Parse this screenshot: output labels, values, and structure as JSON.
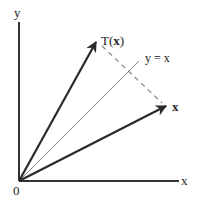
{
  "diagram": {
    "title": "",
    "labels": {
      "y_axis": "y",
      "x_axis": "x",
      "origin": "0",
      "vector_x": "x",
      "transform_prefix": "T(",
      "transform_arg": "x",
      "transform_suffix": ")",
      "line_label": "y = x"
    },
    "colors": {
      "axis": "#333333",
      "vector": "#2a2a2a",
      "line": "#888888",
      "dashed": "#888888"
    },
    "elements": [
      {
        "type": "axis",
        "name": "x-axis"
      },
      {
        "type": "axis",
        "name": "y-axis"
      },
      {
        "type": "vector",
        "name": "x",
        "from": [
          0,
          0
        ],
        "to": "x"
      },
      {
        "type": "vector",
        "name": "T(x)",
        "from": [
          0,
          0
        ],
        "to": "T(x)"
      },
      {
        "type": "line",
        "name": "y = x"
      },
      {
        "type": "dashed-segment",
        "name": "reflection-connector",
        "between": [
          "x",
          "T(x)"
        ]
      }
    ]
  }
}
